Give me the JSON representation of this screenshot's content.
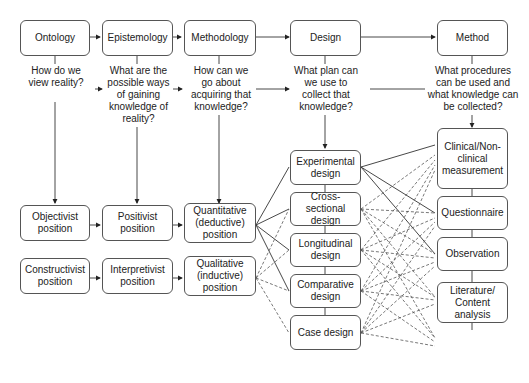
{
  "diagram": {
    "header_boxes": {
      "ontology": "Ontology",
      "epistemology": "Epistemology",
      "methodology": "Methodology",
      "design": "Design",
      "method": "Method"
    },
    "questions": {
      "ontology": "How do we view reality?",
      "epistemology": "What are the possible ways of gaining knowledge of reality?",
      "methodology": "How can we go about acquiring that knowledge?",
      "design": "What plan can we use to collect that knowledge?",
      "method": "What procedures can be used and what knowledge can be collected?"
    },
    "positions": {
      "objectivist": "Objectivist position",
      "positivist": "Positivist position",
      "quantitative": "Quantitative (deductive) position",
      "constructivist": "Constructivist position",
      "interpretivist": "Interpretivist position",
      "qualitative": "Qualitative (inductive) position"
    },
    "designs": [
      "Experimental design",
      "Cross-sectional design",
      "Longitudinal design",
      "Comparative design",
      "Case design"
    ],
    "methods": [
      "Clinical/Non-clinical measurement",
      "Questionnaire",
      "Observation",
      "Literature/ Content analysis",
      "Interview",
      "Focus group"
    ],
    "legend_note": {
      "solid_lines": "quantitative links",
      "dashed_lines": "qualitative links"
    }
  }
}
